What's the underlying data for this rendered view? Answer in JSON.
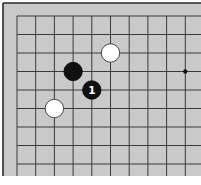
{
  "board": {
    "background": "#c9c9c9",
    "line_color": "#3a3a3a",
    "border_color": "#2a2a2a",
    "origin_x": 17,
    "origin_y": 16,
    "spacing_x": 18.7,
    "spacing_y": 18.5,
    "cols": 10,
    "rows": 9,
    "view": "top-left corner fragment"
  },
  "hoshi": [
    {
      "col": 9,
      "row": 3
    }
  ],
  "stones": [
    {
      "color": "white",
      "col": 5,
      "row": 2,
      "label": ""
    },
    {
      "color": "black",
      "col": 3,
      "row": 3,
      "label": ""
    },
    {
      "color": "black",
      "col": 4,
      "row": 4,
      "label": "1"
    },
    {
      "color": "white",
      "col": 2,
      "row": 5,
      "label": ""
    }
  ]
}
